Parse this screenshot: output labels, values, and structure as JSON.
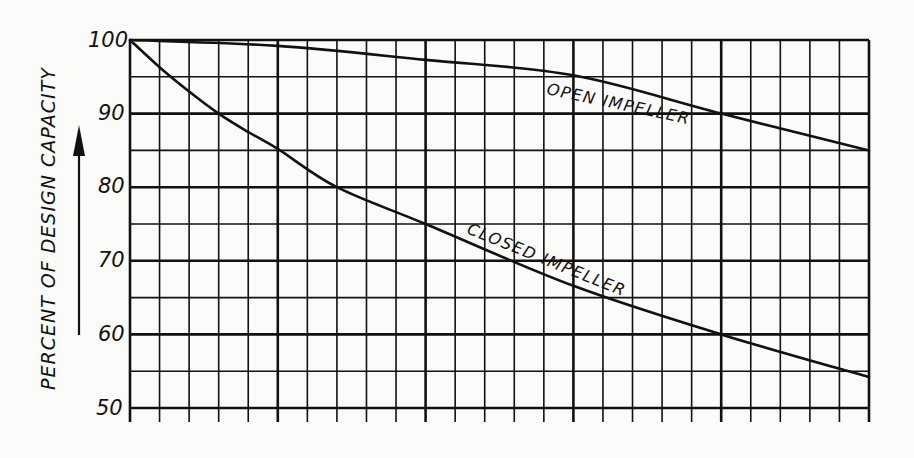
{
  "chart_data": {
    "type": "line",
    "title": "",
    "xlabel": "",
    "ylabel": "PERCENT OF DESIGN CAPACITY",
    "ylabel_arrow": "up",
    "ylim": [
      50,
      100
    ],
    "yticks": [
      100,
      90,
      80,
      70,
      60,
      50
    ],
    "y_minor_step": 5,
    "x_grid_columns": 25,
    "x_major_every": 5,
    "x_tick_labels": [],
    "grid": true,
    "legend": "inline labels",
    "x": [
      0,
      1,
      2,
      3,
      4,
      5,
      7,
      10,
      15,
      20,
      25
    ],
    "series": [
      {
        "name": "OPEN IMPELLER",
        "x": [
          0,
          5,
          10,
          15,
          20,
          25
        ],
        "values": [
          100,
          99.2,
          97.3,
          95.2,
          90,
          85
        ]
      },
      {
        "name": "CLOSED IMPELLER",
        "x": [
          0,
          1,
          2,
          3,
          4,
          5,
          7,
          10,
          15,
          20,
          25
        ],
        "values": [
          100,
          96.3,
          93,
          90,
          87.5,
          85.2,
          80,
          75,
          66.6,
          60,
          54.2
        ]
      }
    ],
    "annotations": [
      "OPEN IMPELLER",
      "CLOSED IMPELLER"
    ]
  },
  "labels": {
    "y_title": "PERCENT OF DESIGN CAPACITY",
    "yticks": [
      "100",
      "90",
      "80",
      "70",
      "60",
      "50"
    ],
    "open_label": "OPEN IMPELLER",
    "closed_label": "CLOSED IMPELLER"
  },
  "colors": {
    "ink": "#111111",
    "paper": "#fbfbf9"
  }
}
